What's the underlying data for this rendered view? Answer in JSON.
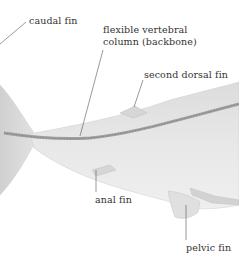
{
  "diagram": {
    "labels": {
      "caudal_fin": "caudal fin",
      "backbone_line1": "flexible vertebral",
      "backbone_line2": "column (backbone)",
      "second_dorsal_fin": "second dorsal fin",
      "anal_fin": "anal fin",
      "pelvic_fin": "pelvic fin"
    },
    "colors": {
      "body": "#e6e6e6",
      "body_shade": "#d4d4d4",
      "spine": "#9a9a9a",
      "leader_line": "#555555",
      "text": "#333333"
    }
  }
}
